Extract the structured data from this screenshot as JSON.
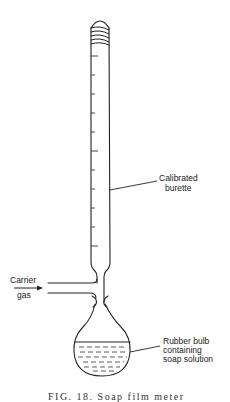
{
  "diagram": {
    "title": "Soap film meter",
    "labels": {
      "burette_line1": "Calibrated",
      "burette_line2": "burette",
      "gas_line1": "Carrier",
      "gas_line2": "gas",
      "bulb_line1": "Rubber bulb",
      "bulb_line2": "containing",
      "bulb_line3": "soap solution"
    },
    "caption": "FIG. 18. Soap film meter",
    "components": [
      {
        "id": "burette",
        "name": "Calibrated burette",
        "graduation_ticks": 11
      },
      {
        "id": "side-arm",
        "name": "Carrier gas inlet",
        "flow": "in"
      },
      {
        "id": "bulb",
        "name": "Rubber bulb containing soap solution"
      }
    ]
  }
}
